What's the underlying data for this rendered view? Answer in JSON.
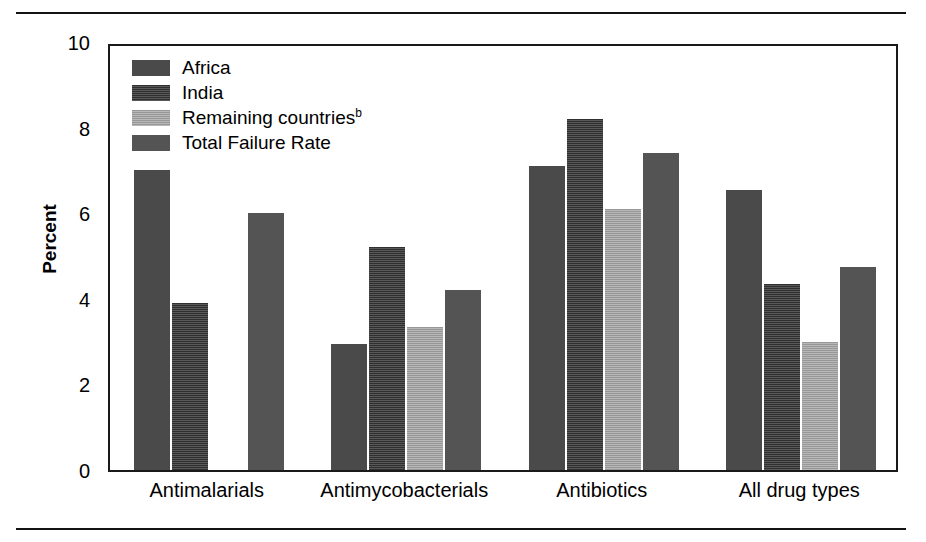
{
  "chart_data": {
    "type": "bar",
    "title": "",
    "xlabel": "",
    "ylabel": "Percent",
    "ylim": [
      0,
      10
    ],
    "ytick_labels": [
      "0",
      "2",
      "4",
      "6",
      "8",
      "10"
    ],
    "ytick_values": [
      0,
      2,
      4,
      6,
      8,
      10
    ],
    "grid": false,
    "legend_position": "top-left inside plot",
    "categories": [
      "Antimalarials",
      "Antimycobacterials",
      "Antibiotics",
      "All drug types"
    ],
    "series": [
      {
        "name": "Africa",
        "color": "#4a4a4a",
        "values": [
          7.0,
          2.95,
          7.1,
          6.55
        ]
      },
      {
        "name": "India",
        "color": "#454545",
        "values": [
          3.9,
          5.2,
          8.2,
          4.35
        ]
      },
      {
        "name": "Remaining countries",
        "color": "#a8a8a8",
        "values": [
          null,
          3.35,
          6.1,
          3.0
        ]
      },
      {
        "name": "Total Failure Rate",
        "color": "#545454",
        "values": [
          6.0,
          4.2,
          7.4,
          4.75
        ]
      }
    ],
    "legend_entries": [
      {
        "label": "Africa",
        "superscript": ""
      },
      {
        "label": "India",
        "superscript": ""
      },
      {
        "label": "Remaining countries",
        "superscript": "b"
      },
      {
        "label": "Total Failure Rate",
        "superscript": ""
      }
    ]
  }
}
